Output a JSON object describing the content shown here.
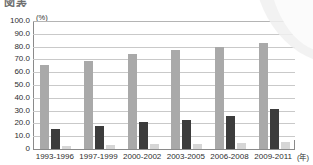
{
  "heading": {
    "text": "図表"
  },
  "chart_data": {
    "type": "bar",
    "title": "",
    "subtitle": "",
    "xlabel": "(年)",
    "ylabel": "(%)",
    "ylim": [
      0,
      100
    ],
    "ytick_step": 10,
    "grid": true,
    "legend_position": "none",
    "categories": [
      "1993-1996",
      "1997-1999",
      "2000-2002",
      "2003-2005",
      "2006-2008",
      "2009-2011"
    ],
    "ytick_labels": [
      "100.0",
      "90.0",
      "80.0",
      "70.0",
      "60.0",
      "50.0",
      "40.0",
      "30.0",
      "20.0",
      "10.0",
      "0"
    ],
    "series": [
      {
        "name": "series-1",
        "color": "#a9a9a9",
        "values": [
          65.5,
          68.5,
          74.0,
          77.0,
          80.0,
          83.0
        ]
      },
      {
        "name": "series-2",
        "color": "#3c3c3c",
        "values": [
          15.5,
          18.0,
          21.0,
          22.5,
          26.0,
          31.0
        ]
      },
      {
        "name": "series-3",
        "color": "#d6d6d6",
        "values": [
          2.5,
          2.8,
          3.8,
          3.8,
          4.8,
          5.8
        ]
      }
    ]
  }
}
